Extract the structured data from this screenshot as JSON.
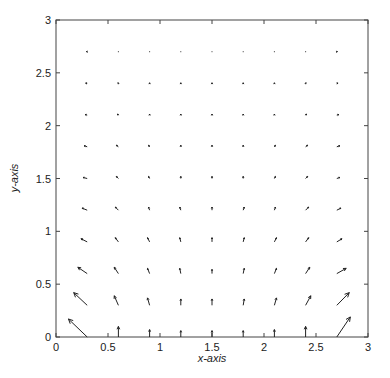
{
  "chart_data": {
    "type": "quiver",
    "title": "",
    "xlabel": "x-axis",
    "ylabel": "y-axis",
    "xlim": [
      0,
      3
    ],
    "ylim": [
      0,
      3
    ],
    "xticks": [
      "0",
      "0.5",
      "1",
      "1.5",
      "2",
      "2.5",
      "3"
    ],
    "yticks": [
      "0",
      "0.5",
      "1",
      "1.5",
      "2",
      "2.5",
      "3"
    ],
    "grid": false,
    "legend": null,
    "grid_x": [
      0.3,
      0.6,
      0.9,
      1.2,
      1.5,
      1.8,
      2.1,
      2.4,
      2.7
    ],
    "grid_y": [
      0,
      0.3,
      0.6,
      0.9,
      1.2,
      1.5,
      1.8,
      2.1,
      2.4,
      2.7
    ],
    "vectors_u": [
      [
        -0.18,
        0,
        0,
        0,
        0,
        0,
        0,
        0,
        0.13
      ],
      [
        -0.13,
        -0.04,
        -0.02,
        0,
        0,
        0.01,
        0.02,
        0.05,
        0.12
      ],
      [
        -0.09,
        -0.04,
        -0.02,
        -0.01,
        0,
        0.01,
        0.02,
        0.04,
        0.09
      ],
      [
        -0.06,
        -0.03,
        -0.02,
        -0.01,
        0,
        0.01,
        0.02,
        0.03,
        0.05
      ],
      [
        -0.05,
        -0.03,
        -0.01,
        -0.01,
        0,
        0.01,
        0.01,
        0.03,
        0.04
      ],
      [
        -0.04,
        -0.02,
        -0.01,
        0,
        0,
        0,
        0.01,
        0.02,
        0.03
      ],
      [
        -0.03,
        -0.02,
        -0.01,
        0,
        0,
        0,
        0.01,
        0.02,
        0.03
      ],
      [
        -0.02,
        -0.01,
        0,
        0,
        0,
        0,
        0,
        0.01,
        0.02
      ],
      [
        -0.015,
        -0.005,
        0,
        0,
        0,
        0,
        0,
        0.005,
        0.012
      ],
      [
        -0.008,
        -0.003,
        0,
        0,
        0,
        0,
        0,
        0.003,
        0.006
      ]
    ],
    "vectors_v": [
      [
        0.17,
        0.1,
        0.07,
        0.06,
        0.06,
        0.06,
        0.07,
        0.1,
        0.19
      ],
      [
        0.12,
        0.09,
        0.07,
        0.06,
        0.06,
        0.06,
        0.07,
        0.09,
        0.12
      ],
      [
        0.06,
        0.06,
        0.05,
        0.05,
        0.04,
        0.05,
        0.05,
        0.06,
        0.05
      ],
      [
        0.03,
        0.04,
        0.04,
        0.04,
        0.04,
        0.04,
        0.04,
        0.04,
        0.03
      ],
      [
        0.02,
        0.03,
        0.03,
        0.03,
        0.03,
        0.03,
        0.03,
        0.03,
        0.02
      ],
      [
        0.01,
        0.02,
        0.02,
        0.02,
        0.02,
        0.02,
        0.02,
        0.02,
        0.01
      ],
      [
        0.01,
        0.015,
        0.015,
        0.015,
        0.015,
        0.015,
        0.015,
        0.015,
        0.01
      ],
      [
        0.005,
        0.01,
        0.01,
        0.01,
        0.01,
        0.01,
        0.01,
        0.01,
        0.005
      ],
      [
        0.002,
        0.006,
        0.006,
        0.006,
        0.006,
        0.006,
        0.006,
        0.006,
        0.002
      ],
      [
        0.001,
        0.003,
        0.003,
        0.003,
        0.003,
        0.003,
        0.003,
        0.003,
        0.001
      ]
    ]
  },
  "colors": {
    "axis": "#444444",
    "arrow": "#222222",
    "text": "#222222"
  }
}
